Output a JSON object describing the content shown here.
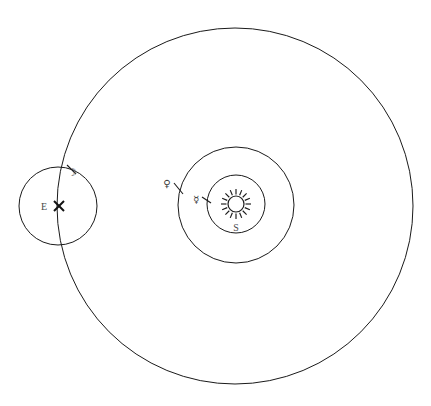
{
  "figure": {
    "background_color": "#ffffff",
    "stroke_color": "#1a1a1a",
    "label_color": "#4a4a4a",
    "width": 431,
    "height": 406
  },
  "chart_data": {
    "type": "diagram",
    "subtitle": "",
    "xlabel": "",
    "ylabel": "",
    "grid": false,
    "legend": "none",
    "xlim": [
      0,
      431
    ],
    "ylim": [
      0,
      406
    ],
    "circles": [
      {
        "name": "solar-orbit-around-earth",
        "label": "Sun orbit (largest circle)",
        "cx": 235,
        "cy": 206,
        "r": 178,
        "stroke": "#1a1a1a",
        "stroke_width": 1,
        "fill": "none"
      },
      {
        "name": "venus-orbit",
        "label": "Venus orbit",
        "cx": 236,
        "cy": 205,
        "r": 58,
        "stroke": "#1a1a1a",
        "stroke_width": 1,
        "fill": "none"
      },
      {
        "name": "mercury-orbit",
        "label": "Mercury orbit",
        "cx": 236,
        "cy": 204,
        "r": 29,
        "stroke": "#1a1a1a",
        "stroke_width": 1,
        "fill": "none"
      },
      {
        "name": "lunar-orbit-around-earth",
        "label": "Moon orbit around Earth",
        "cx": 58,
        "cy": 206,
        "r": 39,
        "stroke": "#1a1a1a",
        "stroke_width": 1,
        "fill": "none"
      }
    ],
    "bodies": [
      {
        "name": "sun",
        "symbol_label": "S",
        "label_text": "S",
        "cx": 236,
        "cy": 204,
        "body_radius": 8,
        "ray_count": 16,
        "ray_inner": 9.5,
        "ray_outer": 15,
        "label_x": 236,
        "label_y": 231
      },
      {
        "name": "earth",
        "symbol_label": "E",
        "label_text": "E",
        "cx": 58,
        "cy": 206,
        "marker": "x",
        "marker_x": 59,
        "marker_y": 206,
        "marker_size": 5,
        "label_x": 44,
        "label_y": 210
      }
    ],
    "planet_markers": [
      {
        "name": "venus",
        "glyph": "♀",
        "glyph_x": 167,
        "glyph_y": 187,
        "tick_x1": 174,
        "tick_y1": 183,
        "tick_x2": 183,
        "tick_y2": 194,
        "on_circle": "venus-orbit"
      },
      {
        "name": "mercury",
        "glyph": "☿",
        "glyph_x": 196,
        "glyph_y": 203,
        "tick_x1": 202,
        "tick_y1": 197,
        "tick_x2": 211,
        "tick_y2": 203,
        "on_circle": "mercury-orbit"
      },
      {
        "name": "moon",
        "glyph": "☽",
        "glyph_x": 72,
        "glyph_y": 176,
        "tick_x1": 67,
        "tick_y1": 165,
        "tick_x2": 76,
        "tick_y2": 174,
        "on_circle": "lunar-orbit-around-earth"
      }
    ],
    "annotations": [
      {
        "name": "sun-label",
        "text": "S",
        "x": 236,
        "y": 231
      },
      {
        "name": "earth-label",
        "text": "E",
        "x": 44,
        "y": 210
      }
    ]
  },
  "labels": {
    "sun": "S",
    "earth": "E"
  },
  "glyphs": {
    "venus": "♀",
    "mercury": "☿",
    "moon": "☽"
  }
}
